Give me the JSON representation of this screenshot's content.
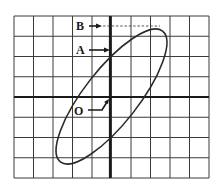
{
  "diagram": {
    "type": "oscilloscope-lissajous-ellipse",
    "grid": {
      "columns": 10,
      "rows": 8
    },
    "labels": {
      "B": "B",
      "A": "A",
      "O": "O"
    },
    "colors": {
      "grid": "#3a3a3a",
      "axis": "#1a1a1a",
      "curve": "#2a2a2a",
      "background": "#ffffff"
    }
  }
}
